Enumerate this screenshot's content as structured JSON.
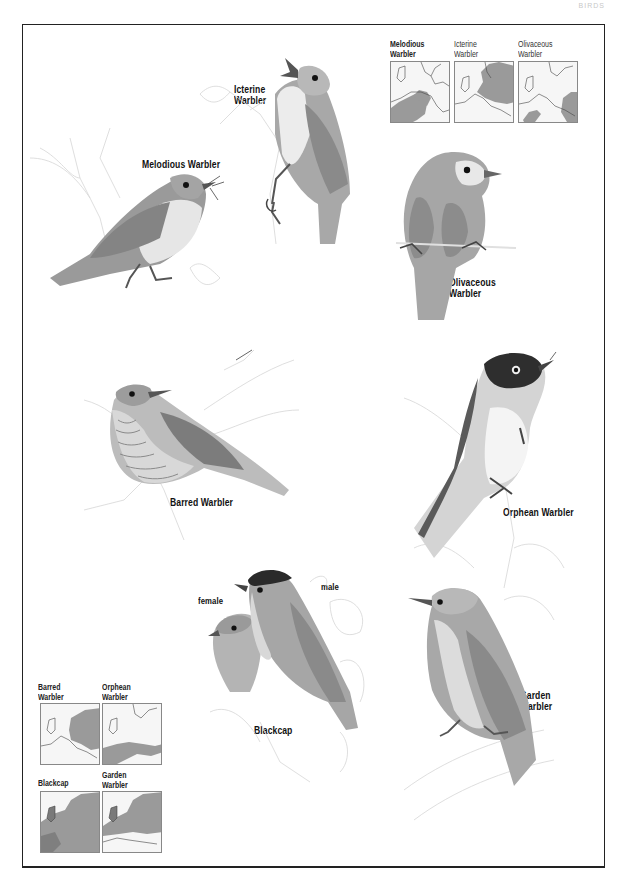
{
  "page": {
    "running_head": "BIRDS"
  },
  "species": {
    "icterine": {
      "label_line1": "Icterine",
      "label_line2": "Warbler"
    },
    "melodious": {
      "label": "Melodious Warbler"
    },
    "olivaceous": {
      "label_line1": "Olivaceous",
      "label_line2": "Warbler"
    },
    "barred": {
      "label": "Barred Warbler"
    },
    "orphean": {
      "label": "Orphean Warbler"
    },
    "blackcap": {
      "label": "Blackcap",
      "female_label": "female",
      "male_label": "male"
    },
    "garden": {
      "label_line1": "Garden",
      "label_line2": "Warbler"
    }
  },
  "range_maps_top": [
    {
      "title_line1": "Melodious",
      "title_line2": "Warbler",
      "range": "southwest-europe"
    },
    {
      "title_line1": "Icterine",
      "title_line2": "Warbler",
      "range": "central-northeast-europe"
    },
    {
      "title_line1": "Olivaceous",
      "title_line2": "Warbler",
      "range": "southeast-europe-iberia"
    }
  ],
  "range_maps_bottom": [
    {
      "title_line1": "Barred",
      "title_line2": "Warbler",
      "range": "eastern-europe"
    },
    {
      "title_line1": "Orphean",
      "title_line2": "Warbler",
      "range": "mediterranean"
    },
    {
      "title_line1": "Blackcap",
      "title_line2": "",
      "range": "most-of-europe"
    },
    {
      "title_line1": "Garden",
      "title_line2": "Warbler",
      "range": "central-northern-europe"
    }
  ],
  "colors": {
    "border": "#222222",
    "bird_dark": "#3a3a3a",
    "bird_mid": "#8a8a8a",
    "bird_light": "#bdbdbd",
    "bird_pale": "#e4e4e4",
    "range_fill": "#9a9a9a",
    "foliage": "#d6d6d6"
  }
}
